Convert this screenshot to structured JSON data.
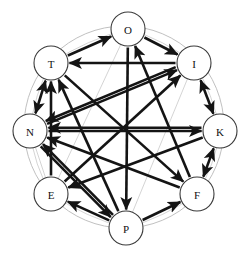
{
  "figure": {
    "type": "directed-graph",
    "title": "",
    "background_color": "#ffffff",
    "node_fill": "#ffffff",
    "node_stroke": "#3a3a3a",
    "edge_color": "#141414",
    "faint_edge_color": "#c9c9c9",
    "ring_color": "#b9b9b9",
    "layout": "circular",
    "center": {
      "x": 124,
      "y": 127
    },
    "radius": 100
  },
  "nodes": [
    {
      "id": "O",
      "label": "O",
      "x": 128,
      "y": 29,
      "r": 17
    },
    {
      "id": "I",
      "label": "I",
      "x": 194,
      "y": 63,
      "r": 17
    },
    {
      "id": "K",
      "label": "K",
      "x": 220,
      "y": 131,
      "r": 17
    },
    {
      "id": "F",
      "label": "F",
      "x": 197,
      "y": 194,
      "r": 17
    },
    {
      "id": "P",
      "label": "P",
      "x": 126,
      "y": 228,
      "r": 17
    },
    {
      "id": "E",
      "label": "E",
      "x": 51,
      "y": 194,
      "r": 17
    },
    {
      "id": "N",
      "label": "N",
      "x": 30,
      "y": 131,
      "r": 17
    },
    {
      "id": "T",
      "label": "T",
      "x": 51,
      "y": 63,
      "r": 17
    }
  ],
  "ring_path_nodes": [
    "O",
    "I",
    "K",
    "F",
    "P",
    "E",
    "N",
    "T"
  ],
  "edges": [
    {
      "from": "T",
      "to": "O",
      "weight": "heavy",
      "directed": true,
      "bidirectional": false
    },
    {
      "from": "O",
      "to": "I",
      "weight": "heavy",
      "directed": true,
      "bidirectional": false
    },
    {
      "from": "I",
      "to": "T",
      "weight": "heavy",
      "directed": true,
      "bidirectional": false
    },
    {
      "from": "N",
      "to": "I",
      "weight": "heavy",
      "directed": true,
      "bidirectional": false
    },
    {
      "from": "N",
      "to": "K",
      "weight": "heavy",
      "directed": true,
      "bidirectional": false
    },
    {
      "from": "T",
      "to": "N",
      "weight": "heavy",
      "directed": true,
      "bidirectional": true
    },
    {
      "from": "I",
      "to": "K",
      "weight": "heavy",
      "directed": true,
      "bidirectional": true
    },
    {
      "from": "K",
      "to": "F",
      "weight": "heavy",
      "directed": true,
      "bidirectional": true
    },
    {
      "from": "E",
      "to": "T",
      "weight": "heavy",
      "directed": true,
      "bidirectional": false
    },
    {
      "from": "P",
      "to": "T",
      "weight": "heavy",
      "directed": true,
      "bidirectional": false
    },
    {
      "from": "F",
      "to": "O",
      "weight": "heavy",
      "directed": true,
      "bidirectional": false
    },
    {
      "from": "K",
      "to": "N",
      "weight": "heavy",
      "directed": true,
      "bidirectional": false
    },
    {
      "from": "F",
      "to": "N",
      "weight": "heavy",
      "directed": true,
      "bidirectional": false
    },
    {
      "from": "P",
      "to": "N",
      "weight": "heavy",
      "directed": true,
      "bidirectional": false
    },
    {
      "from": "I",
      "to": "N",
      "weight": "heavy",
      "directed": true,
      "bidirectional": false
    },
    {
      "from": "K",
      "to": "E",
      "weight": "heavy",
      "directed": true,
      "bidirectional": false
    },
    {
      "from": "P",
      "to": "E",
      "weight": "heavy",
      "directed": true,
      "bidirectional": false
    },
    {
      "from": "P",
      "to": "F",
      "weight": "heavy",
      "directed": true,
      "bidirectional": false
    },
    {
      "from": "T",
      "to": "F",
      "weight": "heavy",
      "directed": true,
      "bidirectional": false
    },
    {
      "from": "N",
      "to": "P",
      "weight": "heavy",
      "directed": true,
      "bidirectional": false
    },
    {
      "from": "O",
      "to": "P",
      "weight": "heavy",
      "directed": true,
      "bidirectional": false
    },
    {
      "from": "E",
      "to": "I",
      "weight": "heavy",
      "directed": true,
      "bidirectional": false
    }
  ],
  "faint_edges": [
    {
      "from": "T",
      "to": "P"
    },
    {
      "from": "N",
      "to": "F"
    },
    {
      "from": "E",
      "to": "K"
    },
    {
      "from": "O",
      "to": "E"
    },
    {
      "from": "P",
      "to": "I"
    },
    {
      "from": "N",
      "to": "E"
    },
    {
      "from": "E",
      "to": "P"
    },
    {
      "from": "P",
      "to": "F"
    },
    {
      "from": "F",
      "to": "K"
    },
    {
      "from": "K",
      "to": "I"
    },
    {
      "from": "I",
      "to": "O"
    },
    {
      "from": "O",
      "to": "T"
    },
    {
      "from": "T",
      "to": "N"
    }
  ]
}
